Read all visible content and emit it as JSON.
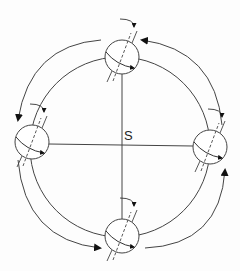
{
  "diagram": {
    "center_label": "S",
    "line_color": "#444444",
    "arrow_color": "#111111",
    "bodies": [
      {
        "name": "earth-top",
        "cx": 122,
        "cy": 57
      },
      {
        "name": "earth-left",
        "cx": 32,
        "cy": 142
      },
      {
        "name": "earth-right",
        "cx": 210,
        "cy": 147
      },
      {
        "name": "earth-bottom",
        "cx": 122,
        "cy": 236
      }
    ]
  }
}
